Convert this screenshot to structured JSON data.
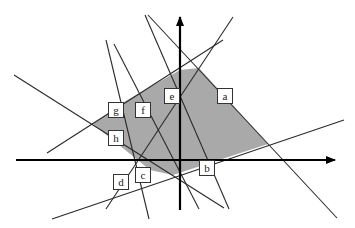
{
  "diagram": {
    "colors": {
      "region_fill": "#a9a9a9",
      "line_stroke": "#2a2a2a",
      "axis_stroke": "#000000",
      "label_bg": "#ffffff"
    },
    "axes": {
      "x_axis": {
        "x1": 16,
        "y1": 160,
        "x2": 335,
        "y2": 160
      },
      "y_axis": {
        "x1": 180,
        "y1": 210,
        "x2": 180,
        "y2": 17
      }
    },
    "region_polygon": "93,124 124,102 180,70 199,68 268,144 173,175 150,170",
    "lines": [
      {
        "id": "a",
        "x1": 148,
        "y1": 15,
        "x2": 337,
        "y2": 218
      },
      {
        "id": "b",
        "x1": 52,
        "y1": 219,
        "x2": 344,
        "y2": 120
      },
      {
        "id": "c",
        "x1": 106,
        "y1": 40,
        "x2": 149,
        "y2": 219
      },
      {
        "id": "d",
        "x1": 106,
        "y1": 209,
        "x2": 233,
        "y2": 17
      },
      {
        "id": "e",
        "x1": 145,
        "y1": 15,
        "x2": 229,
        "y2": 209
      },
      {
        "id": "f",
        "x1": 114,
        "y1": 44,
        "x2": 199,
        "y2": 209
      },
      {
        "id": "g",
        "x1": 47,
        "y1": 153,
        "x2": 223,
        "y2": 40
      },
      {
        "id": "h",
        "x1": 14,
        "y1": 75,
        "x2": 224,
        "y2": 208
      }
    ],
    "labels": [
      {
        "text": "a",
        "x": 225,
        "y": 96
      },
      {
        "text": "b",
        "x": 207,
        "y": 168
      },
      {
        "text": "c",
        "x": 143,
        "y": 175
      },
      {
        "text": "d",
        "x": 121,
        "y": 182
      },
      {
        "text": "e",
        "x": 172,
        "y": 96
      },
      {
        "text": "f",
        "x": 143,
        "y": 110
      },
      {
        "text": "g",
        "x": 116,
        "y": 110
      },
      {
        "text": "h",
        "x": 116,
        "y": 138
      }
    ]
  }
}
